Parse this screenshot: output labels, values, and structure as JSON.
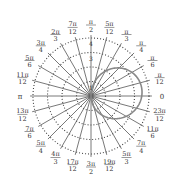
{
  "diagram": {
    "type": "polar-graph",
    "center": {
      "x": 91,
      "y": 96
    },
    "unit_px": 14.5,
    "rings": [
      1,
      2,
      3,
      4
    ],
    "ring_labels_visible": [
      "1",
      "3",
      "4"
    ],
    "angle_step": "π/12",
    "angle_labels": [
      {
        "deg": 0,
        "num": "0",
        "den": ""
      },
      {
        "deg": 15,
        "num": "π",
        "den": "12"
      },
      {
        "deg": 30,
        "num": "π",
        "den": "6"
      },
      {
        "deg": 45,
        "num": "π",
        "den": "4"
      },
      {
        "deg": 60,
        "num": "π",
        "den": "3"
      },
      {
        "deg": 75,
        "num": "5π",
        "den": "12"
      },
      {
        "deg": 90,
        "num": "π",
        "den": "2"
      },
      {
        "deg": 105,
        "num": "7π",
        "den": "12"
      },
      {
        "deg": 120,
        "num": "2π",
        "den": "3"
      },
      {
        "deg": 135,
        "num": "3π",
        "den": "4"
      },
      {
        "deg": 150,
        "num": "5π",
        "den": "6"
      },
      {
        "deg": 165,
        "num": "11π",
        "den": "12"
      },
      {
        "deg": 180,
        "num": "π",
        "den": ""
      },
      {
        "deg": 195,
        "num": "13π",
        "den": "12"
      },
      {
        "deg": 210,
        "num": "7π",
        "den": "6"
      },
      {
        "deg": 225,
        "num": "5π",
        "den": "4"
      },
      {
        "deg": 240,
        "num": "4π",
        "den": "3"
      },
      {
        "deg": 255,
        "num": "17π",
        "den": "12"
      },
      {
        "deg": 270,
        "num": "3π",
        "den": "2"
      },
      {
        "deg": 285,
        "num": "19π",
        "den": "12"
      },
      {
        "deg": 300,
        "num": "5π",
        "den": "3"
      },
      {
        "deg": 315,
        "num": "7π",
        "den": "4"
      },
      {
        "deg": 330,
        "num": "11π",
        "den": "6"
      },
      {
        "deg": 345,
        "num": "23π",
        "den": "12"
      }
    ],
    "curve": {
      "description": "closed loop through pole, bulging to the right",
      "max_r": 3.5,
      "color": "#888888"
    },
    "colors": {
      "grid": "#555555",
      "ring": "#444444",
      "text": "#333333"
    }
  }
}
